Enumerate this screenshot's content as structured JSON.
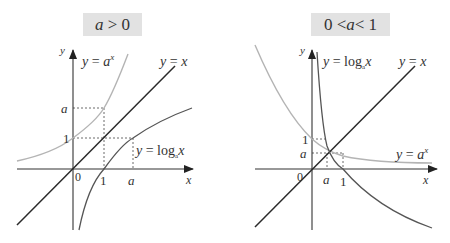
{
  "panels": [
    {
      "title": "a > 0",
      "title_parts": {
        "var": "a",
        "rest": " > 0"
      },
      "curves": {
        "exponential_label": "y = a^x",
        "identity_label": "y = x",
        "log_label": "y = log_a x"
      },
      "axis": {
        "x": "x",
        "y": "y",
        "origin": "0"
      },
      "ticks": {
        "x": [
          "1",
          "a"
        ],
        "y": [
          "1",
          "a"
        ]
      }
    },
    {
      "title": "0 < a < 1",
      "title_parts": {
        "left": "0 <",
        "var": "a",
        "right": "< 1"
      },
      "curves": {
        "exponential_label": "y = a^x",
        "identity_label": "y = x",
        "log_label": "y = log_a x"
      },
      "axis": {
        "x": "x",
        "y": "y",
        "origin": "0"
      },
      "ticks": {
        "x": [
          "a",
          "1"
        ],
        "y": [
          "1",
          "a"
        ]
      }
    }
  ],
  "colors": {
    "axis": "#333333",
    "identity_line": "#2a2a2a",
    "exponential_curve": "#b4b4b4",
    "log_curve": "#555555",
    "title_bg": "#e2e2e2"
  }
}
